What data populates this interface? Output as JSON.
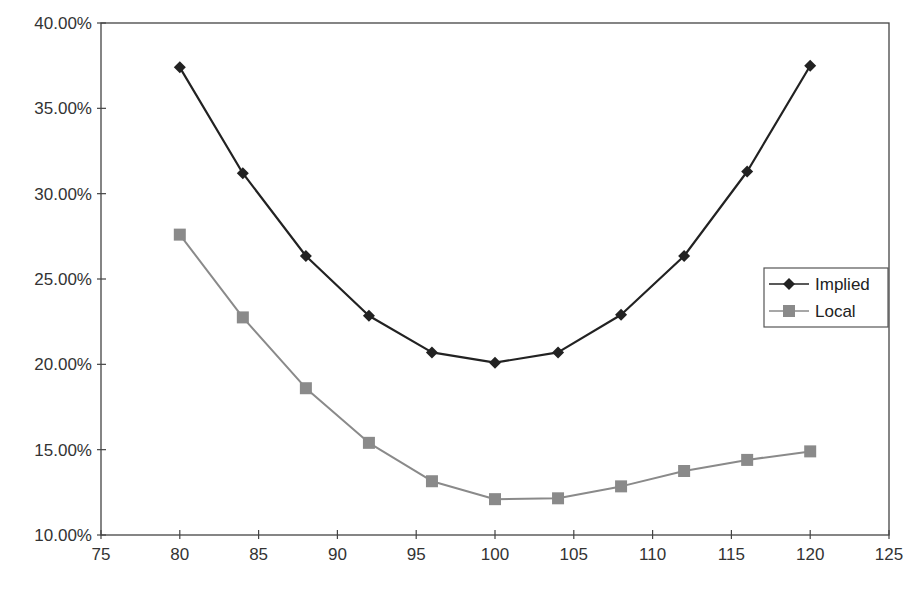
{
  "chart_data": {
    "type": "line",
    "title": "",
    "xlabel": "",
    "ylabel": "",
    "x": [
      80,
      84,
      88,
      92,
      96,
      100,
      104,
      108,
      112,
      116,
      120
    ],
    "series": [
      {
        "name": "Implied",
        "marker": "diamond",
        "color": "#222222",
        "values": [
          37.4,
          31.2,
          26.35,
          22.85,
          20.7,
          20.1,
          20.7,
          22.9,
          26.35,
          31.3,
          37.5
        ]
      },
      {
        "name": "Local",
        "marker": "square",
        "color": "#8a8a8a",
        "values": [
          27.6,
          22.75,
          18.6,
          15.4,
          13.15,
          12.1,
          12.15,
          12.85,
          13.75,
          14.4,
          14.9
        ]
      }
    ],
    "xlim": [
      75,
      125
    ],
    "ylim": [
      10,
      40
    ],
    "x_ticks": [
      75,
      80,
      85,
      90,
      95,
      100,
      105,
      110,
      115,
      120,
      125
    ],
    "y_ticks": [
      "10.00%",
      "15.00%",
      "20.00%",
      "25.00%",
      "30.00%",
      "35.00%",
      "40.00%"
    ],
    "y_tick_values": [
      10,
      15,
      20,
      25,
      30,
      35,
      40
    ],
    "grid": false,
    "legend_position": "right-inside"
  },
  "legend": {
    "items": [
      {
        "label": "Implied"
      },
      {
        "label": "Local"
      }
    ]
  }
}
